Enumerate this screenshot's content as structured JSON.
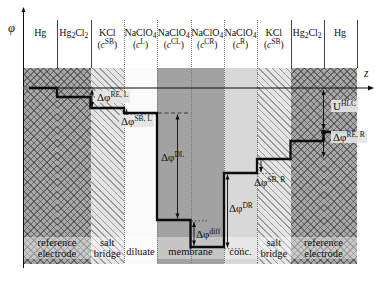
{
  "axes": {
    "phi": "φ",
    "z": "z"
  },
  "colors": {
    "line": "#0b0b0b",
    "electrode_bg": "#a8a8a8",
    "saltbridge_bg": "#e4e4e4",
    "diluate_bg": "#fafafa",
    "membrane_bg": "#a2a2a2",
    "conc_bg": "#d8d8d8"
  },
  "columns": [
    {
      "id": "hg-left",
      "x1": 23.5,
      "x2": 57,
      "bg": "refelec",
      "line1": [
        {
          "t": "Hg"
        }
      ]
    },
    {
      "id": "hg2cl2-left",
      "x1": 57,
      "x2": 90.5,
      "bg": "refelec",
      "line1": [
        {
          "t": "Hg"
        },
        {
          "t": "2",
          "sub": true
        },
        {
          "t": "Cl"
        },
        {
          "t": "2",
          "sub": true
        }
      ]
    },
    {
      "id": "kcl-left",
      "x1": 90.5,
      "x2": 124,
      "bg": "saltbridge",
      "line1": [
        {
          "t": "KCl"
        }
      ],
      "line2": [
        {
          "t": "("
        },
        {
          "t": "c",
          "i": true
        },
        {
          "t": "SB",
          "sup": true
        },
        {
          "t": ")"
        }
      ]
    },
    {
      "id": "naclo4-l",
      "x1": 124,
      "x2": 157,
      "bg": "diluate",
      "line1": [
        {
          "t": "NaClO"
        },
        {
          "t": "4",
          "sub": true
        }
      ],
      "line2": [
        {
          "t": "("
        },
        {
          "t": "c",
          "i": true
        },
        {
          "t": "L",
          "sup": true
        },
        {
          "t": ")"
        }
      ]
    },
    {
      "id": "naclo4-cl",
      "x1": 157,
      "x2": 190.5,
      "bg": "membrane",
      "line1": [
        {
          "t": "NaClO"
        },
        {
          "t": "4",
          "sub": true
        }
      ],
      "line2": [
        {
          "t": "("
        },
        {
          "t": "c",
          "i": true
        },
        {
          "t": "CL",
          "sup": true
        },
        {
          "t": ")"
        }
      ]
    },
    {
      "id": "naclo4-cr",
      "x1": 190.5,
      "x2": 224,
      "bg": "membrane",
      "line1": [
        {
          "t": "NaClO"
        },
        {
          "t": "4",
          "sub": true
        }
      ],
      "line2": [
        {
          "t": "("
        },
        {
          "t": "c",
          "i": true
        },
        {
          "t": "CR",
          "sup": true
        },
        {
          "t": ")"
        }
      ]
    },
    {
      "id": "naclo4-r",
      "x1": 224,
      "x2": 257,
      "bg": "conc",
      "line1": [
        {
          "t": "NaClO"
        },
        {
          "t": "4",
          "sub": true
        }
      ],
      "line2": [
        {
          "t": "("
        },
        {
          "t": "c",
          "i": true
        },
        {
          "t": "R",
          "sup": true
        },
        {
          "t": ")"
        }
      ]
    },
    {
      "id": "kcl-right",
      "x1": 257,
      "x2": 290.5,
      "bg": "saltbridge",
      "line1": [
        {
          "t": "KCl"
        }
      ],
      "line2": [
        {
          "t": "("
        },
        {
          "t": "c",
          "i": true
        },
        {
          "t": "SB",
          "sup": true
        },
        {
          "t": ")"
        }
      ]
    },
    {
      "id": "hg2cl2-right",
      "x1": 290.5,
      "x2": 323.5,
      "bg": "refelec",
      "line1": [
        {
          "t": "Hg"
        },
        {
          "t": "2",
          "sub": true
        },
        {
          "t": "Cl"
        },
        {
          "t": "2",
          "sub": true
        }
      ]
    },
    {
      "id": "hg-right",
      "x1": 323.5,
      "x2": 356.5,
      "bg": "refelec",
      "line1": [
        {
          "t": "Hg"
        }
      ]
    }
  ],
  "dividers": [
    {
      "x": 57,
      "style": "solid",
      "y1": 20,
      "y2": 68
    },
    {
      "x": 90.5,
      "style": "solid",
      "y1": 20,
      "y2": 68
    },
    {
      "x": 124,
      "style": "dotted",
      "y1": 20,
      "y2": 263
    },
    {
      "x": 157,
      "style": "dotted",
      "y1": 20,
      "y2": 263
    },
    {
      "x": 190.5,
      "style": "dotted",
      "y1": 20,
      "y2": 263
    },
    {
      "x": 224,
      "style": "dotted",
      "y1": 20,
      "y2": 263
    },
    {
      "x": 257,
      "style": "dotted",
      "y1": 20,
      "y2": 263
    },
    {
      "x": 290.5,
      "style": "solid",
      "y1": 20,
      "y2": 68
    },
    {
      "x": 323.5,
      "style": "solid",
      "y1": 20,
      "y2": 68
    },
    {
      "x": 356.5,
      "style": "solid",
      "y1": 20,
      "y2": 68
    }
  ],
  "regions": [
    {
      "id": "reference-electrode-left",
      "cx": 57,
      "lines": [
        "reference",
        "electrode"
      ]
    },
    {
      "id": "salt-bridge-left",
      "cx": 107.2,
      "lines": [
        "salt",
        "bridge"
      ]
    },
    {
      "id": "diluate",
      "cx": 140.5,
      "lines": [
        "diluate"
      ]
    },
    {
      "id": "membrane",
      "cx": 190.5,
      "lines": [
        "membrane"
      ]
    },
    {
      "id": "conc",
      "cx": 240.5,
      "lines": [
        "conc."
      ]
    },
    {
      "id": "salt-bridge-right",
      "cx": 273.8,
      "lines": [
        "salt",
        "bridge"
      ]
    },
    {
      "id": "reference-electrode-right",
      "cx": 323.5,
      "lines": [
        "reference",
        "electrode"
      ]
    }
  ],
  "profile": {
    "points": [
      [
        23.5,
        88
      ],
      [
        57,
        88
      ],
      [
        57,
        97
      ],
      [
        90.5,
        97
      ],
      [
        90.5,
        108
      ],
      [
        124,
        108
      ],
      [
        124,
        113
      ],
      [
        157,
        113
      ],
      [
        157,
        220
      ],
      [
        190.5,
        220
      ],
      [
        190.5,
        247
      ],
      [
        224,
        247
      ],
      [
        224,
        173
      ],
      [
        257,
        173
      ],
      [
        257,
        159
      ],
      [
        290.5,
        159
      ],
      [
        290.5,
        141
      ],
      [
        323.5,
        141
      ],
      [
        323.5,
        132
      ],
      [
        356.5,
        132
      ]
    ],
    "terminal_dot": {
      "x": 323.5,
      "y": 132,
      "r": 2.6
    },
    "start_arrow": {
      "x": 23.5,
      "y": 88
    }
  },
  "annotations": [
    {
      "id": "dphi-re-l",
      "label": [
        {
          "t": "Δφ"
        },
        {
          "t": "RE, L",
          "sup": true
        }
      ],
      "lx": 95,
      "ly": 91,
      "bg": true,
      "line": {
        "x": 92,
        "y1": 89.5,
        "y2": 107
      },
      "heads": "both"
    },
    {
      "id": "dphi-sb-l",
      "label": [
        {
          "t": "Δφ"
        },
        {
          "t": "SB, L",
          "sup": true
        }
      ],
      "lx": 119,
      "ly": 115,
      "bg": true,
      "line": {
        "x": 126.5,
        "y1": 109.5,
        "y2": 112.5
      },
      "heads": "up",
      "dotted": {
        "y": 114.2,
        "x1": 127,
        "x2": 156
      }
    },
    {
      "id": "dphi-dl",
      "label": [
        {
          "t": "Δφ"
        },
        {
          "t": "DL",
          "sup": true
        }
      ],
      "lx": 161,
      "ly": 151,
      "bg": false,
      "line": {
        "x": 177.5,
        "y1": 114.5,
        "y2": 218.5
      },
      "heads": "both",
      "dashed": {
        "y": 113,
        "x1": 158,
        "x2": 189
      }
    },
    {
      "id": "dphi-diff",
      "label": [
        {
          "t": "Δφ"
        },
        {
          "t": "diff",
          "sup": true
        }
      ],
      "lx": 196,
      "ly": 228,
      "bg": false,
      "line": {
        "x": 194,
        "y1": 222,
        "y2": 245.5
      },
      "heads": "both",
      "dotted": {
        "y": 220.8,
        "x1": 191.5,
        "x2": 209
      }
    },
    {
      "id": "dphi-dr",
      "label": [
        {
          "t": "Δφ"
        },
        {
          "t": "DR",
          "sup": true
        }
      ],
      "lx": 229,
      "ly": 202,
      "bg": false,
      "line": {
        "x": 227.5,
        "y1": 174.5,
        "y2": 247.5
      },
      "heads": "both",
      "dotted": {
        "y": 248.8,
        "x1": 224.5,
        "x2": 243
      }
    },
    {
      "id": "dphi-sb-r",
      "label": [
        {
          "t": "Δφ"
        },
        {
          "t": "SB, R",
          "sup": true
        }
      ],
      "lx": 254,
      "ly": 176,
      "bg": false,
      "line": {
        "x": 261,
        "y1": 160.5,
        "y2": 172
      },
      "heads": "down",
      "dotted": {
        "y": 173.6,
        "x1": 258.5,
        "x2": 275
      }
    },
    {
      "id": "dphi-re-r",
      "label": [
        {
          "t": "Δφ"
        },
        {
          "t": "RE, R",
          "sup": true
        }
      ],
      "lx": 331,
      "ly": 131,
      "bg": true,
      "line": {
        "x": 323.5,
        "y1": 135,
        "y2": 157
      },
      "heads": "both"
    },
    {
      "id": "u-hlc",
      "label": [
        {
          "t": "U"
        },
        {
          "t": "HLC",
          "sup": true
        }
      ],
      "lx": 331,
      "ly": 100,
      "bg": true,
      "line": {
        "x": 323.5,
        "y1": 90,
        "y2": 129
      },
      "heads": "both"
    }
  ],
  "geometry": {
    "phi_axis": {
      "x": 23.5,
      "y1": 8,
      "y2": 268
    },
    "z_axis": {
      "y": 88,
      "x1": 23.5,
      "x2": 372
    },
    "band": {
      "y1": 68,
      "y2": 264
    }
  }
}
